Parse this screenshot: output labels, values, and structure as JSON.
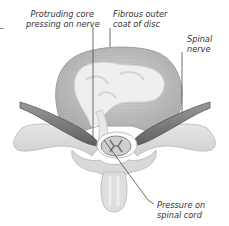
{
  "diagram": {
    "style": "grayscale medical illustration, top-down cross-section of vertebra and intervertebral disc",
    "colors": {
      "background": "#ffffff",
      "disc_outer": "#bdbdbd",
      "disc_core": "#ececec",
      "bone": "#dcdcdc",
      "nerve": "#7a7a7a",
      "leader_line": "#333333",
      "label_text": "#333333"
    },
    "labels": {
      "protruding_core": {
        "line1": "Protruding core",
        "line2": "pressing on nerve"
      },
      "fibrous_coat": {
        "line1": "Fibrous outer",
        "line2": "coat of disc"
      },
      "spinal_nerve": {
        "line1": "Spinal",
        "line2": "nerve"
      },
      "pressure_cord": {
        "line1": "Pressure on",
        "line2": "spinal cord"
      }
    },
    "parts": [
      "intervertebral-disc",
      "nucleus-core",
      "annulus-fibrous-coat",
      "left-spinal-nerve",
      "right-spinal-nerve",
      "spinal-cord",
      "vertebral-arch",
      "transverse-process-left",
      "transverse-process-right",
      "spinous-process"
    ]
  }
}
